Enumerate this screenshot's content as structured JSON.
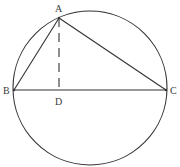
{
  "diagram": {
    "stroke_color": "#333333",
    "circle": {
      "cx": 90,
      "cy": 88,
      "r": 77
    },
    "points": {
      "A": {
        "label": "A",
        "x": 59,
        "y": 18
      },
      "B": {
        "label": "B",
        "x": 14,
        "y": 90
      },
      "C": {
        "label": "C",
        "x": 166,
        "y": 90
      },
      "D": {
        "label": "D",
        "x": 59,
        "y": 90
      }
    },
    "segments": [
      {
        "from": "A",
        "to": "B",
        "style": "solid"
      },
      {
        "from": "A",
        "to": "C",
        "style": "solid"
      },
      {
        "from": "B",
        "to": "C",
        "style": "solid"
      },
      {
        "from": "A",
        "to": "D",
        "style": "dashed"
      }
    ],
    "labels": {
      "A": "A",
      "B": "B",
      "C": "C",
      "D": "D"
    }
  }
}
